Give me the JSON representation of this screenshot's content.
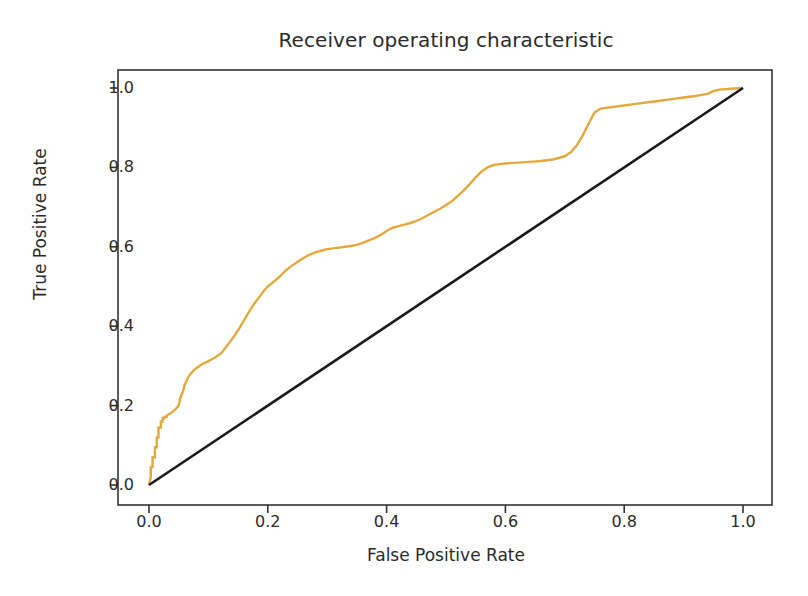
{
  "chart_data": {
    "type": "line",
    "title": "Receiver operating characteristic",
    "xlabel": "False Positive Rate",
    "ylabel": "True Positive Rate",
    "xlim": [
      -0.05,
      1.05
    ],
    "ylim": [
      -0.05,
      1.05
    ],
    "grid": false,
    "legend": "none",
    "xticks": [
      "0.0",
      "0.2",
      "0.4",
      "0.6",
      "0.8",
      "1.0"
    ],
    "xtick_values": [
      0.0,
      0.2,
      0.4,
      0.6,
      0.8,
      1.0
    ],
    "yticks": [
      "0.0",
      "0.2",
      "0.4",
      "0.6",
      "0.8",
      "1.0"
    ],
    "ytick_values": [
      0.0,
      0.2,
      0.4,
      0.6,
      0.8,
      1.0
    ],
    "series": [
      {
        "name": "ROC curve",
        "color": "#e3a93f",
        "style": "step",
        "width": 2.4,
        "x": [
          0.0,
          0.003,
          0.003,
          0.006,
          0.006,
          0.01,
          0.01,
          0.013,
          0.013,
          0.016,
          0.016,
          0.02,
          0.02,
          0.023,
          0.023,
          0.026,
          0.026,
          0.03,
          0.03,
          0.033,
          0.036,
          0.04,
          0.045,
          0.05,
          0.052,
          0.055,
          0.058,
          0.06,
          0.063,
          0.066,
          0.07,
          0.075,
          0.08,
          0.085,
          0.09,
          0.095,
          0.1,
          0.105,
          0.11,
          0.115,
          0.12,
          0.125,
          0.13,
          0.135,
          0.14,
          0.145,
          0.15,
          0.155,
          0.16,
          0.165,
          0.17,
          0.175,
          0.18,
          0.185,
          0.19,
          0.195,
          0.2,
          0.21,
          0.22,
          0.23,
          0.24,
          0.25,
          0.26,
          0.27,
          0.28,
          0.29,
          0.3,
          0.31,
          0.32,
          0.33,
          0.34,
          0.35,
          0.36,
          0.37,
          0.38,
          0.39,
          0.4,
          0.41,
          0.42,
          0.43,
          0.44,
          0.45,
          0.46,
          0.47,
          0.48,
          0.49,
          0.5,
          0.51,
          0.52,
          0.53,
          0.54,
          0.55,
          0.56,
          0.57,
          0.58,
          0.6,
          0.62,
          0.64,
          0.66,
          0.68,
          0.7,
          0.71,
          0.72,
          0.73,
          0.74,
          0.75,
          0.76,
          0.78,
          0.8,
          0.82,
          0.84,
          0.86,
          0.88,
          0.9,
          0.92,
          0.94,
          0.95,
          0.96,
          0.98,
          1.0
        ],
        "y": [
          0.0,
          0.02,
          0.045,
          0.045,
          0.07,
          0.07,
          0.095,
          0.095,
          0.12,
          0.12,
          0.145,
          0.145,
          0.16,
          0.16,
          0.168,
          0.168,
          0.172,
          0.172,
          0.175,
          0.178,
          0.18,
          0.185,
          0.192,
          0.2,
          0.215,
          0.228,
          0.24,
          0.252,
          0.262,
          0.272,
          0.28,
          0.288,
          0.295,
          0.3,
          0.305,
          0.308,
          0.312,
          0.316,
          0.32,
          0.325,
          0.33,
          0.338,
          0.348,
          0.358,
          0.368,
          0.378,
          0.39,
          0.402,
          0.415,
          0.428,
          0.44,
          0.452,
          0.462,
          0.472,
          0.482,
          0.492,
          0.5,
          0.512,
          0.525,
          0.54,
          0.552,
          0.562,
          0.572,
          0.58,
          0.586,
          0.59,
          0.594,
          0.596,
          0.598,
          0.6,
          0.602,
          0.605,
          0.61,
          0.616,
          0.622,
          0.63,
          0.64,
          0.648,
          0.652,
          0.656,
          0.66,
          0.665,
          0.672,
          0.68,
          0.688,
          0.696,
          0.705,
          0.715,
          0.728,
          0.742,
          0.758,
          0.775,
          0.79,
          0.8,
          0.806,
          0.81,
          0.812,
          0.814,
          0.816,
          0.82,
          0.828,
          0.838,
          0.855,
          0.88,
          0.91,
          0.938,
          0.948,
          0.952,
          0.956,
          0.96,
          0.964,
          0.968,
          0.972,
          0.976,
          0.98,
          0.985,
          0.992,
          0.996,
          0.998,
          1.0
        ]
      },
      {
        "name": "chance reference line",
        "color": "#1a1a1a",
        "style": "line",
        "width": 2.6,
        "x": [
          0.0,
          1.0
        ],
        "y": [
          0.0,
          1.0
        ]
      }
    ]
  },
  "figure": {
    "background": "#fefefe",
    "axes_color": "#333333",
    "text_color": "#2b2b2b"
  }
}
